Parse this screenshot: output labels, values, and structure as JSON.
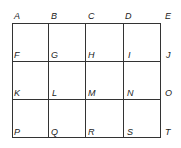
{
  "diagram": {
    "type": "grid",
    "rows": 3,
    "cols": 4,
    "labels": {
      "row0": [
        "A",
        "B",
        "C",
        "D",
        "E"
      ],
      "row1": [
        "F",
        "G",
        "H",
        "I",
        "J"
      ],
      "row2": [
        "K",
        "L",
        "M",
        "N",
        "O"
      ],
      "row3": [
        "P",
        "Q",
        "R",
        "S",
        "T"
      ]
    }
  }
}
